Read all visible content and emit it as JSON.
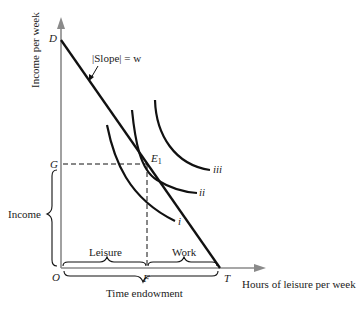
{
  "diagram": {
    "y_axis_label": "Income per week",
    "x_axis_label": "Hours of leisure per week",
    "points": {
      "D": "D",
      "G": "G",
      "O": "O",
      "F": "F",
      "T": "T",
      "E1_main": "E",
      "E1_sub": "1"
    },
    "slope_label": "|Slope| = w",
    "indifference_curves": [
      "i",
      "ii",
      "iii"
    ],
    "braces": {
      "income": "Income",
      "leisure": "Leisure",
      "work": "Work",
      "time_endowment": "Time endowment"
    },
    "colors": {
      "axis": "#888888",
      "line": "#111111",
      "text": "#222222"
    }
  }
}
